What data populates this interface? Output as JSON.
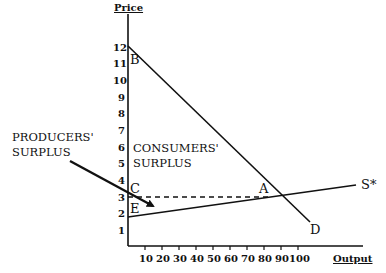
{
  "axes": {
    "y_title": "Price",
    "x_title": "Output",
    "y_ticks": [
      "12",
      "11",
      "10",
      "9",
      "8",
      "7",
      "6",
      "5",
      "4",
      "3",
      "2",
      "1"
    ],
    "x_ticks": [
      "10",
      "20",
      "30",
      "40",
      "50",
      "60",
      "70",
      "80",
      "90",
      "100"
    ]
  },
  "points": {
    "B": "B",
    "C": "C",
    "E": "E",
    "A": "A",
    "D": "D",
    "S": "S*"
  },
  "regions": {
    "consumers_line1": "CONSUMERS'",
    "consumers_line2": "SURPLUS",
    "producers_line1": "PRODUCERS'",
    "producers_line2": "SURPLUS"
  },
  "curves": {
    "demand": {
      "label": "D",
      "from": [
        0,
        12
      ],
      "to": [
        107,
        -1.5
      ]
    },
    "supply": {
      "label": "S*",
      "from": [
        0,
        1.8
      ],
      "to": [
        134,
        3.7
      ]
    },
    "price_line": {
      "price": 3,
      "from_x": 0,
      "to_x": 85
    }
  },
  "colors": {
    "ink": "#111111",
    "background": "#ffffff"
  }
}
